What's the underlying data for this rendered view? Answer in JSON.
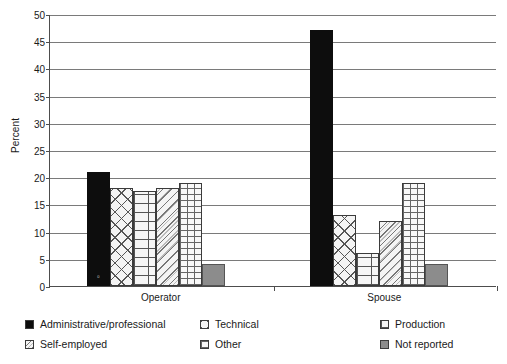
{
  "chart_data": {
    "type": "bar",
    "title": "",
    "xlabel": "",
    "ylabel": "Percent",
    "ylim": [
      0,
      50
    ],
    "yticks": [
      0,
      5,
      10,
      15,
      20,
      25,
      30,
      35,
      40,
      45,
      50
    ],
    "grid": true,
    "legend_position": "bottom",
    "categories": [
      "Operator",
      "Spouse"
    ],
    "series": [
      {
        "name": "Administrative/professional",
        "values": [
          21,
          47
        ],
        "pattern": "solid-black",
        "color": "#0d0d0d"
      },
      {
        "name": "Technical",
        "values": [
          18,
          13
        ],
        "pattern": "cross-diag",
        "color": "#f4f4f4"
      },
      {
        "name": "Production",
        "values": [
          17.5,
          6
        ],
        "pattern": "brick",
        "color": "#f6f6f6"
      },
      {
        "name": "Self-employed",
        "values": [
          18,
          12
        ],
        "pattern": "diag-dots",
        "color": "#f4f4f4"
      },
      {
        "name": "Other",
        "values": [
          19,
          19
        ],
        "pattern": "dots-grid",
        "color": "#f8f8f8"
      },
      {
        "name": "Not reported",
        "values": [
          4,
          4
        ],
        "pattern": "gray",
        "color": "#8c8c8c"
      }
    ],
    "inbar_annotation": "0"
  },
  "legend": {
    "items": [
      {
        "label": "Administrative/professional",
        "pattern": "solid-black"
      },
      {
        "label": "Technical",
        "pattern": "cross-diag"
      },
      {
        "label": "Production",
        "pattern": "brick"
      },
      {
        "label": "Self-employed",
        "pattern": "diag-dots"
      },
      {
        "label": "Other",
        "pattern": "dots-grid"
      },
      {
        "label": "Not reported",
        "pattern": "gray"
      }
    ]
  }
}
